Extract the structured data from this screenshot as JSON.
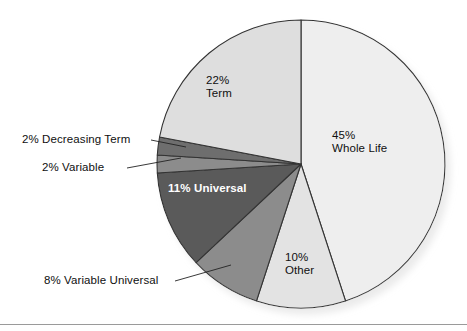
{
  "chart_data": {
    "type": "pie",
    "title": "",
    "subtitle": "",
    "xlabel": "",
    "ylabel": "",
    "legend_position": "none",
    "grid": false,
    "units": "percent",
    "start_angle_deg": 0,
    "direction": "clockwise",
    "categories": [
      "Whole Life",
      "Other",
      "Variable Universal",
      "Universal",
      "Variable",
      "Decreasing Term",
      "Term"
    ],
    "values": [
      45,
      10,
      8,
      11,
      2,
      2,
      22
    ],
    "slices": [
      {
        "name": "Whole Life",
        "value": 45,
        "percent_text": "45%",
        "label_line1": "45%",
        "label_line2": "Whole Life",
        "color": "#eeeeee",
        "label_placement": "inside",
        "text_color": "#101010"
      },
      {
        "name": "Other",
        "value": 10,
        "percent_text": "10%",
        "label_line1": "10%",
        "label_line2": "Other",
        "color": "#e3e3e3",
        "label_placement": "inside",
        "text_color": "#101010"
      },
      {
        "name": "Variable Universal",
        "value": 8,
        "percent_text": "8%",
        "label_line1": "8% Variable Universal",
        "label_line2": "",
        "color": "#8c8c8c",
        "label_placement": "callout",
        "text_color": "#101010"
      },
      {
        "name": "Universal",
        "value": 11,
        "percent_text": "11%",
        "label_line1": "11% Universal",
        "label_line2": "",
        "color": "#5a5a5a",
        "label_placement": "inside",
        "text_color": "#ffffff"
      },
      {
        "name": "Variable",
        "value": 2,
        "percent_text": "2%",
        "label_line1": "2% Variable",
        "label_line2": "",
        "color": "#8c8c8c",
        "label_placement": "callout",
        "text_color": "#101010"
      },
      {
        "name": "Decreasing Term",
        "value": 2,
        "percent_text": "2%",
        "label_line1": "2% Decreasing Term",
        "label_line2": "",
        "color": "#6e6e6e",
        "label_placement": "callout",
        "text_color": "#101010"
      },
      {
        "name": "Term",
        "value": 22,
        "percent_text": "22%",
        "label_line1": "22%",
        "label_line2": "Term",
        "color": "#dedede",
        "label_placement": "inside",
        "text_color": "#101010"
      }
    ]
  },
  "figure": {
    "background_color": "#ffffff",
    "outline_color": "#333333",
    "shadow_color": "#cfcfcf",
    "rule_color": "#9a9a9a",
    "leader_line_color": "#222222"
  },
  "labels": {
    "term": {
      "line1": "22%",
      "line2": "Term"
    },
    "whole_life": {
      "line1": "45%",
      "line2": "Whole Life"
    },
    "other": {
      "line1": "10%",
      "line2": "Other"
    },
    "universal": {
      "text": "11% Universal"
    },
    "decreasing_term": {
      "text": "2% Decreasing Term"
    },
    "variable": {
      "text": "2% Variable"
    },
    "variable_universal": {
      "text": "8% Variable Universal"
    }
  }
}
